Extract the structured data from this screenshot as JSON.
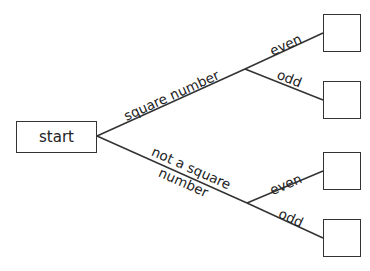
{
  "diagram": {
    "type": "tree",
    "start": {
      "label": "start"
    },
    "branches": [
      {
        "label": "square number",
        "children": [
          {
            "label": "even"
          },
          {
            "label": "odd"
          }
        ]
      },
      {
        "label_line1": "not a square",
        "label_line2": "number",
        "children": [
          {
            "label": "even"
          },
          {
            "label": "odd"
          }
        ]
      }
    ],
    "outcome_boxes": [
      "",
      "",
      "",
      ""
    ],
    "line_color": "#333333"
  }
}
